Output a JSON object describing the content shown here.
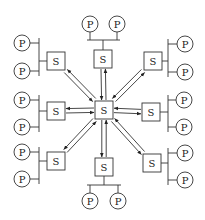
{
  "diagram": {
    "colors": {
      "stroke": "#333333",
      "background": "#ffffff"
    },
    "labels": {
      "switch": "S",
      "processor": "P"
    },
    "center_switch": {
      "label": "S",
      "cx": 104,
      "cy": 110
    },
    "outer_switches": [
      {
        "id": "top",
        "label": "S",
        "cx": 103,
        "cy": 59
      },
      {
        "id": "upper-left",
        "label": "S",
        "cx": 56,
        "cy": 61
      },
      {
        "id": "upper-right",
        "label": "S",
        "cx": 153,
        "cy": 61
      },
      {
        "id": "middle-left",
        "label": "S",
        "cx": 56,
        "cy": 111
      },
      {
        "id": "middle-right",
        "label": "S",
        "cx": 151,
        "cy": 112
      },
      {
        "id": "lower-left",
        "label": "S",
        "cx": 56,
        "cy": 161
      },
      {
        "id": "lower-right",
        "label": "S",
        "cx": 152,
        "cy": 163
      },
      {
        "id": "bottom",
        "label": "S",
        "cx": 104,
        "cy": 167
      }
    ],
    "processors": [
      {
        "group": "top",
        "label": "P",
        "cx": 90,
        "cy": 24
      },
      {
        "group": "top",
        "label": "P",
        "cx": 117,
        "cy": 24
      },
      {
        "group": "upper-left",
        "label": "P",
        "cx": 22,
        "cy": 43
      },
      {
        "group": "upper-left",
        "label": "P",
        "cx": 22,
        "cy": 71
      },
      {
        "group": "middle-left",
        "label": "P",
        "cx": 22,
        "cy": 100
      },
      {
        "group": "middle-left",
        "label": "P",
        "cx": 22,
        "cy": 127
      },
      {
        "group": "lower-left",
        "label": "P",
        "cx": 22,
        "cy": 152
      },
      {
        "group": "lower-left",
        "label": "P",
        "cx": 22,
        "cy": 179
      },
      {
        "group": "upper-right",
        "label": "P",
        "cx": 185,
        "cy": 44
      },
      {
        "group": "upper-right",
        "label": "P",
        "cx": 185,
        "cy": 72
      },
      {
        "group": "middle-right",
        "label": "P",
        "cx": 184,
        "cy": 100
      },
      {
        "group": "middle-right",
        "label": "P",
        "cx": 184,
        "cy": 127
      },
      {
        "group": "lower-right",
        "label": "P",
        "cx": 185,
        "cy": 153
      },
      {
        "group": "lower-right",
        "label": "P",
        "cx": 185,
        "cy": 180
      },
      {
        "group": "bottom",
        "label": "P",
        "cx": 90,
        "cy": 201
      },
      {
        "group": "bottom",
        "label": "P",
        "cx": 118,
        "cy": 201
      }
    ]
  }
}
